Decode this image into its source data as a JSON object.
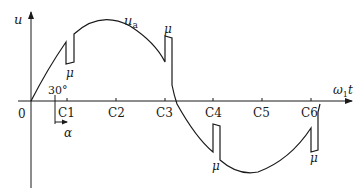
{
  "diagram": {
    "y_axis_label": "u",
    "x_axis_label_main": "ω",
    "x_axis_label_sub": "1",
    "x_axis_label_tail": "t",
    "origin_label": "0",
    "curve_label_main": "u",
    "curve_label_sub": "a",
    "angle_label": "30°",
    "alpha_label": "α",
    "notch_label": "μ",
    "ticks": [
      "C1",
      "C2",
      "C3",
      "C4",
      "C5",
      "C6"
    ],
    "notch_labels": [
      "μ",
      "μ",
      "μ",
      "μ"
    ]
  }
}
